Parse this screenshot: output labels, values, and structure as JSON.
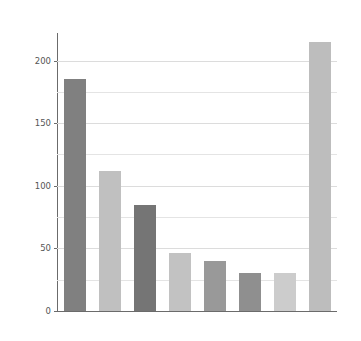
{
  "chart_data": {
    "type": "bar",
    "title": "",
    "subtitle": "",
    "xlabel": "",
    "ylabel": "",
    "categories": [
      "1",
      "2",
      "3",
      "4",
      "5",
      "6",
      "7",
      "8"
    ],
    "values": [
      185,
      112,
      85,
      46,
      40,
      30,
      30,
      215
    ],
    "bar_colors": [
      "#808080",
      "#c0c0c0",
      "#757575",
      "#c2c2c2",
      "#999999",
      "#8f8f8f",
      "#cccccc",
      "#bdbdbd"
    ],
    "ylim": [
      0,
      222
    ],
    "xlim": [
      0,
      8
    ],
    "y_major_ticks": [
      0,
      50,
      100,
      150,
      200
    ],
    "y_major_tick_labels": [
      "0",
      "50",
      "100",
      "150",
      "200"
    ],
    "y_minor_ticks": [
      25,
      75,
      125,
      175
    ],
    "grid": true,
    "grid_axis": "y",
    "legend": null,
    "legend_position": "none",
    "x_tick_labels": [],
    "annotations": [],
    "background_color": "#ffffff",
    "axis_color": "#6b6b6b",
    "grid_color": "#e4e4e4",
    "tick_label_color": "#555555"
  }
}
